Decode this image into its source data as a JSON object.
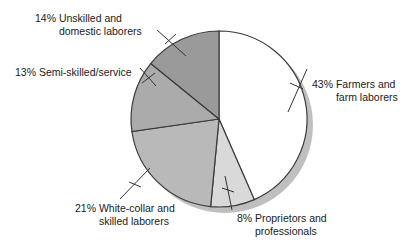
{
  "chart_data": {
    "type": "pie",
    "title": "",
    "xlabel": "",
    "ylabel": "",
    "legend_position": "none",
    "grid": false,
    "units": "percent",
    "start_angle_deg": 0,
    "direction": "clockwise",
    "categories": [
      "Farmers and farm laborers",
      "Proprietors and professionals",
      "White-collar and skilled laborers",
      "Semi-skilled/service",
      "Unskilled and domestic laborers"
    ],
    "values": [
      43,
      8,
      21,
      13,
      14
    ],
    "slices": [
      {
        "label_line1": "Farmers and",
        "label_line2": "farm laborers",
        "percent_text": "43%",
        "value": 43,
        "color": "#ffffff"
      },
      {
        "label_line1": "Proprietors and",
        "label_line2": "professionals",
        "percent_text": "8%",
        "value": 8,
        "color": "#d9d9d9"
      },
      {
        "label_line1": "White-collar and",
        "label_line2": "skilled laborers",
        "percent_text": "21%",
        "value": 21,
        "color": "#b9b9b9"
      },
      {
        "label_line1": "Semi-skilled/service",
        "label_line2": "",
        "percent_text": "13%",
        "value": 13,
        "color": "#ababab"
      },
      {
        "label_line1": "Unskilled and",
        "label_line2": "domestic laborers",
        "percent_text": "14%",
        "value": 14,
        "color": "#9a9a9a"
      }
    ]
  },
  "colors": {
    "outline": "#3a3a3a",
    "shadow": "#b0b0b0",
    "text": "#1a1a1a",
    "leader": "#333333",
    "background": "#ffffff"
  }
}
